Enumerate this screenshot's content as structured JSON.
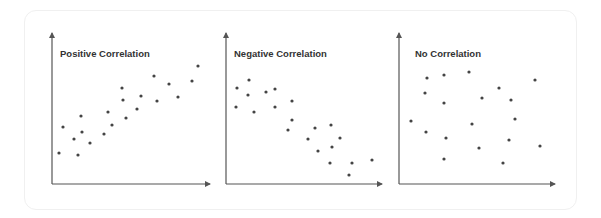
{
  "chart_data": [
    {
      "type": "scatter",
      "title": "Positive Correlation",
      "xlabel": "",
      "ylabel": "",
      "grid": false,
      "axes": {
        "origin": [
          52,
          184
        ],
        "x_end": 210,
        "y_end": 33
      },
      "points_px": [
        [
          59,
          153
        ],
        [
          63,
          127
        ],
        [
          74,
          139
        ],
        [
          78,
          155
        ],
        [
          82,
          132
        ],
        [
          81,
          116
        ],
        [
          90,
          143
        ],
        [
          104,
          134
        ],
        [
          108,
          112
        ],
        [
          112,
          125
        ],
        [
          122,
          88
        ],
        [
          123,
          100
        ],
        [
          126,
          118
        ],
        [
          137,
          109
        ],
        [
          141,
          96
        ],
        [
          154,
          76
        ],
        [
          157,
          101
        ],
        [
          169,
          84
        ],
        [
          178,
          97
        ],
        [
          192,
          81
        ],
        [
          198,
          66
        ]
      ]
    },
    {
      "type": "scatter",
      "title": "Negative Correlation",
      "xlabel": "",
      "ylabel": "",
      "grid": false,
      "axes": {
        "origin": [
          226,
          184
        ],
        "x_end": 382,
        "y_end": 33
      },
      "points_px": [
        [
          236,
          107
        ],
        [
          237,
          88
        ],
        [
          248,
          95
        ],
        [
          249,
          80
        ],
        [
          254,
          112
        ],
        [
          266,
          92
        ],
        [
          275,
          89
        ],
        [
          275,
          107
        ],
        [
          292,
          101
        ],
        [
          292,
          120
        ],
        [
          288,
          130
        ],
        [
          308,
          139
        ],
        [
          315,
          128
        ],
        [
          318,
          151
        ],
        [
          331,
          125
        ],
        [
          330,
          163
        ],
        [
          332,
          147
        ],
        [
          340,
          138
        ],
        [
          352,
          163
        ],
        [
          349,
          175
        ],
        [
          372,
          160
        ]
      ]
    },
    {
      "type": "scatter",
      "title": "No Correlation",
      "xlabel": "",
      "ylabel": "",
      "grid": false,
      "axes": {
        "origin": [
          399,
          184
        ],
        "x_end": 555,
        "y_end": 33
      },
      "points_px": [
        [
          411,
          121
        ],
        [
          426,
          132
        ],
        [
          425,
          93
        ],
        [
          427,
          78
        ],
        [
          444,
          75
        ],
        [
          444,
          103
        ],
        [
          446,
          138
        ],
        [
          444,
          159
        ],
        [
          469,
          72
        ],
        [
          472,
          124
        ],
        [
          479,
          148
        ],
        [
          482,
          98
        ],
        [
          499,
          88
        ],
        [
          503,
          163
        ],
        [
          509,
          140
        ],
        [
          511,
          100
        ],
        [
          515,
          119
        ],
        [
          535,
          80
        ],
        [
          540,
          146
        ]
      ]
    }
  ],
  "panels": [
    {
      "title": "Positive Correlation",
      "title_x": 60,
      "title_y": 57
    },
    {
      "title": "Negative Correlation",
      "title_x": 234,
      "title_y": 57
    },
    {
      "title": "No Correlation",
      "title_x": 415,
      "title_y": 57
    }
  ],
  "colors": {
    "axis": "#555555",
    "dot": "#444444",
    "title": "#333333",
    "card_border": "#f0f0f0"
  }
}
